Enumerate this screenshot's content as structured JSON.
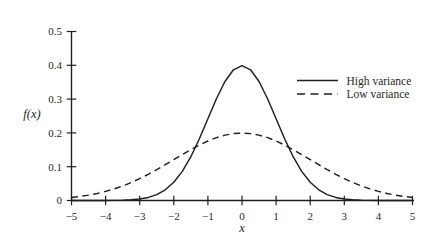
{
  "figure": {
    "background": "#ffffff",
    "ink_color": "#1f1f1f"
  },
  "chart_data": {
    "type": "line",
    "title": "",
    "xlabel": "x",
    "ylabel": "f(x)",
    "xlim": [
      -5,
      5
    ],
    "ylim": [
      0,
      0.5
    ],
    "grid": false,
    "legend_position": "right",
    "x_ticks": [
      -5,
      -4,
      -3,
      -2,
      -1,
      0,
      1,
      2,
      3,
      4,
      5
    ],
    "x_tick_labels": [
      "−5",
      "−4",
      "−3",
      "−2",
      "−1",
      "0",
      "1",
      "2",
      "3",
      "4",
      "5"
    ],
    "y_ticks": [
      0,
      0.1,
      0.2,
      0.3,
      0.4,
      0.5
    ],
    "y_tick_labels": [
      "0",
      "0.1",
      "0.2",
      "0.3",
      "0.4",
      "0.5"
    ],
    "x": [
      -5,
      -4.75,
      -4.5,
      -4.25,
      -4,
      -3.75,
      -3.5,
      -3.25,
      -3,
      -2.75,
      -2.5,
      -2.25,
      -2,
      -1.75,
      -1.5,
      -1.25,
      -1,
      -0.75,
      -0.5,
      -0.25,
      0,
      0.25,
      0.5,
      0.75,
      1,
      1.25,
      1.5,
      1.75,
      2,
      2.25,
      2.5,
      2.75,
      3,
      3.25,
      3.5,
      3.75,
      4,
      4.25,
      4.5,
      4.75,
      5
    ],
    "series": [
      {
        "name": "High variance",
        "line": "solid",
        "values": [
          0,
          0,
          0,
          0.0001,
          0.0001,
          0.0004,
          0.0009,
          0.002,
          0.0044,
          0.0091,
          0.0175,
          0.0317,
          0.054,
          0.0863,
          0.1295,
          0.1826,
          0.242,
          0.3011,
          0.3521,
          0.3867,
          0.3989,
          0.3867,
          0.3521,
          0.3011,
          0.242,
          0.1826,
          0.1295,
          0.0863,
          0.054,
          0.0317,
          0.0175,
          0.0091,
          0.0044,
          0.002,
          0.0009,
          0.0004,
          0.0001,
          0.0001,
          0,
          0,
          0
        ]
      },
      {
        "name": "Low variance",
        "line": "dashed",
        "values": [
          0.0088,
          0.012,
          0.0159,
          0.0209,
          0.027,
          0.0343,
          0.043,
          0.0532,
          0.0647,
          0.0775,
          0.0913,
          0.106,
          0.121,
          0.136,
          0.1506,
          0.1639,
          0.176,
          0.186,
          0.1933,
          0.1979,
          0.1995,
          0.1979,
          0.1933,
          0.186,
          0.176,
          0.1639,
          0.1506,
          0.136,
          0.121,
          0.106,
          0.0913,
          0.0775,
          0.0647,
          0.0532,
          0.043,
          0.0343,
          0.027,
          0.0209,
          0.0159,
          0.012,
          0.0088
        ]
      }
    ]
  }
}
